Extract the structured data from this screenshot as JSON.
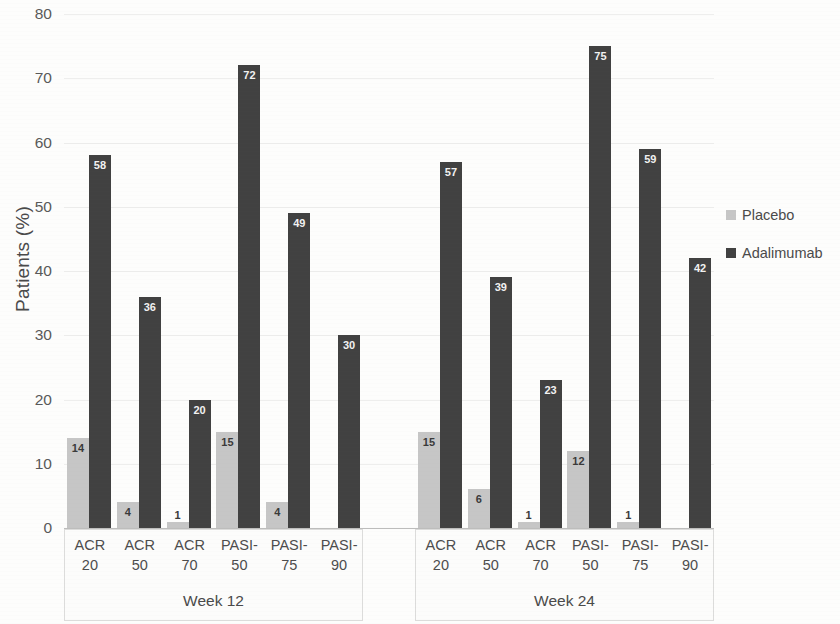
{
  "chart_data": {
    "type": "bar",
    "title": "",
    "subtitle": "",
    "xlabel": "",
    "ylabel": "Patients (%)",
    "ylim": [
      0,
      80
    ],
    "yticks": [
      0,
      10,
      20,
      30,
      40,
      50,
      60,
      70,
      80
    ],
    "ytick_labels": [
      "0",
      "10",
      "20",
      "30",
      "40",
      "50",
      "60",
      "70",
      "80"
    ],
    "grid": true,
    "legend_position": "right",
    "groups": [
      {
        "name": "Week 12",
        "categories": [
          "ACR 20",
          "ACR 50",
          "ACR 70",
          "PASI-50",
          "PASI-75",
          "PASI-90"
        ],
        "category_lines": [
          [
            "ACR",
            "20"
          ],
          [
            "ACR",
            "50"
          ],
          [
            "ACR",
            "70"
          ],
          [
            "PASI-",
            "50"
          ],
          [
            "PASI-",
            "75"
          ],
          [
            "PASI-",
            "90"
          ]
        ],
        "series": [
          {
            "name": "Placebo",
            "values": [
              14,
              4,
              1,
              15,
              4,
              0
            ],
            "labels": [
              "14",
              "4",
              "1",
              "15",
              "4",
              ""
            ]
          },
          {
            "name": "Adalimumab",
            "values": [
              58,
              36,
              20,
              72,
              49,
              30
            ],
            "labels": [
              "58",
              "36",
              "20",
              "72",
              "49",
              "30"
            ]
          }
        ]
      },
      {
        "name": "Week 24",
        "categories": [
          "ACR 20",
          "ACR 50",
          "ACR 70",
          "PASI-50",
          "PASI-75",
          "PASI-90"
        ],
        "category_lines": [
          [
            "ACR",
            "20"
          ],
          [
            "ACR",
            "50"
          ],
          [
            "ACR",
            "70"
          ],
          [
            "PASI-",
            "50"
          ],
          [
            "PASI-",
            "75"
          ],
          [
            "PASI-",
            "90"
          ]
        ],
        "series": [
          {
            "name": "Placebo",
            "values": [
              15,
              6,
              1,
              12,
              1,
              0
            ],
            "labels": [
              "15",
              "6",
              "1",
              "12",
              "1",
              ""
            ]
          },
          {
            "name": "Adalimumab",
            "values": [
              57,
              39,
              23,
              75,
              59,
              42
            ],
            "labels": [
              "57",
              "39",
              "23",
              "75",
              "59",
              "42"
            ]
          }
        ]
      }
    ],
    "series_colors": {
      "Placebo": "#c6c6c6",
      "Adalimumab": "#414141"
    }
  },
  "legend": {
    "items": [
      {
        "label": "Placebo",
        "color": "#c6c6c6"
      },
      {
        "label": "Adalimumab",
        "color": "#414141"
      }
    ]
  }
}
